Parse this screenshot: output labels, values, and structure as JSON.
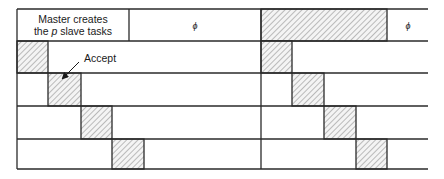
{
  "diagram": {
    "type": "master-slave timing diagram",
    "rows": 5,
    "master_box": {
      "line1": "Master creates",
      "line2_prefix": "the ",
      "line2_var": "p",
      "line2_suffix": " slave tasks"
    },
    "idle_symbol_left": "ϕ",
    "idle_symbol_right": "ϕ",
    "annotation": "Accept",
    "colors": {
      "line": "#2a2a2a",
      "hatch": "#8a8a8a",
      "hatch_bg": "#f4f4f4",
      "text": "#1a1a1a"
    }
  }
}
